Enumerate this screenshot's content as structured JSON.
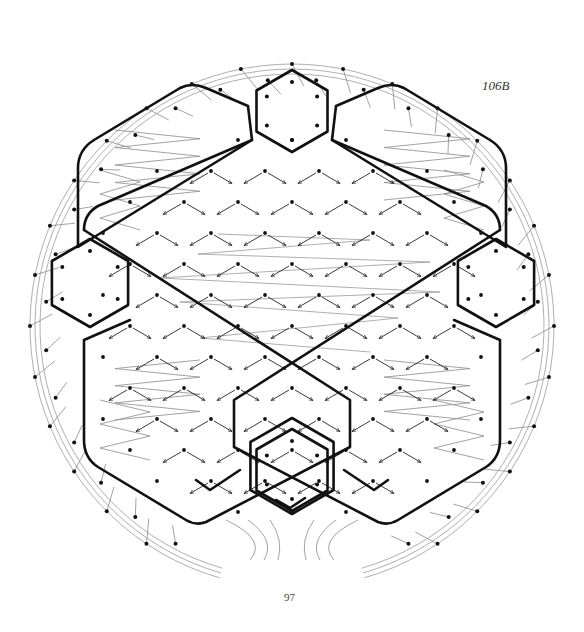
{
  "figure": {
    "label": "106B",
    "page_number": "97",
    "colors": {
      "thick_line": "#111111",
      "thin_line": "#8a8a8a",
      "arrow": "#222222",
      "dot": "#111111",
      "background": "#ffffff"
    },
    "circle": {
      "cx": 292,
      "cy": 326,
      "rings": [
        252,
        257,
        262
      ]
    },
    "hexagons": [
      {
        "name": "top",
        "cx": 292,
        "cy": 111,
        "r": 41
      },
      {
        "name": "bottom",
        "cx": 292,
        "cy": 470,
        "r": 41
      },
      {
        "name": "left",
        "cx": 90,
        "cy": 283,
        "r": 44
      },
      {
        "name": "right",
        "cx": 496,
        "cy": 283,
        "r": 44
      }
    ]
  }
}
